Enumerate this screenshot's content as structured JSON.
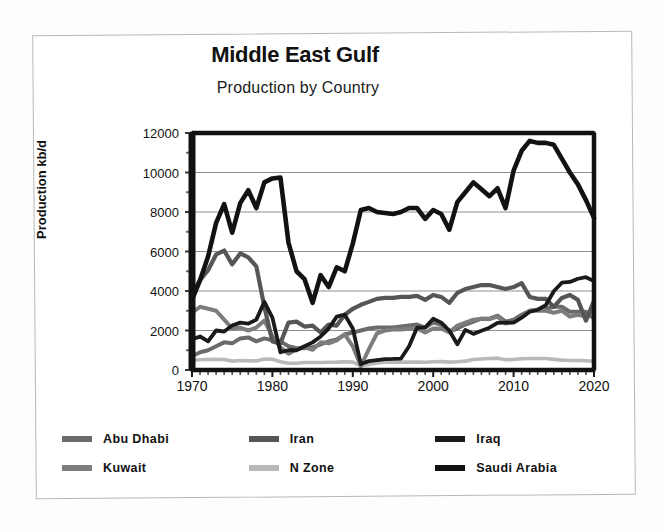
{
  "chart_data": {
    "type": "line",
    "title": "Middle East Gulf",
    "subtitle": "Production by Country",
    "xlabel": "",
    "ylabel": "Production kb/d",
    "xlim": [
      1970,
      2020
    ],
    "ylim": [
      0,
      12000
    ],
    "ytick_step": 2000,
    "yticks": [
      "0",
      "2000",
      "4000",
      "6000",
      "8000",
      "10000",
      "12000"
    ],
    "xticks": [
      "1970",
      "1980",
      "1990",
      "2000",
      "2010",
      "2020"
    ],
    "xtick_minor_step": 1,
    "grid": "horizontal",
    "legend_position": "below",
    "x": [
      1970,
      1971,
      1972,
      1973,
      1974,
      1975,
      1976,
      1977,
      1978,
      1979,
      1980,
      1981,
      1982,
      1983,
      1984,
      1985,
      1986,
      1987,
      1988,
      1989,
      1990,
      1991,
      1992,
      1993,
      1994,
      1995,
      1996,
      1997,
      1998,
      1999,
      2000,
      2001,
      2002,
      2003,
      2004,
      2005,
      2006,
      2007,
      2008,
      2009,
      2010,
      2011,
      2012,
      2013,
      2014,
      2015,
      2016,
      2017,
      2018,
      2019,
      2020
    ],
    "series": [
      {
        "name": "Saudi Arabia",
        "color": "#121212",
        "width": 4.6,
        "values": [
          3550,
          4550,
          5750,
          7450,
          8400,
          6950,
          8450,
          9100,
          8200,
          9500,
          9700,
          9750,
          6450,
          5000,
          4600,
          3400,
          4800,
          4200,
          5200,
          5000,
          6400,
          8100,
          8200,
          8000,
          7950,
          7900,
          8000,
          8200,
          8200,
          7650,
          8100,
          7900,
          7100,
          8500,
          9000,
          9500,
          9150,
          8800,
          9200,
          8200,
          10100,
          11100,
          11600,
          11500,
          11500,
          11400,
          10700,
          10000,
          9400,
          8600,
          7700
        ]
      },
      {
        "name": "Iran",
        "color": "#565656",
        "width": 4.2,
        "values": [
          3850,
          4550,
          5050,
          5850,
          6050,
          5350,
          5900,
          5700,
          5250,
          3200,
          1450,
          1350,
          2400,
          2450,
          2200,
          2250,
          1900,
          2300,
          2250,
          2800,
          3100,
          3300,
          3450,
          3600,
          3650,
          3650,
          3700,
          3700,
          3750,
          3550,
          3800,
          3700,
          3400,
          3900,
          4100,
          4200,
          4300,
          4300,
          4200,
          4100,
          4200,
          4400,
          3700,
          3600,
          3600,
          3200,
          3650,
          3800,
          3550,
          2500,
          3500
        ]
      },
      {
        "name": "Iraq",
        "color": "#1a1a1a",
        "width": 3.8,
        "values": [
          1550,
          1700,
          1450,
          2000,
          1950,
          2250,
          2400,
          2350,
          2550,
          3450,
          2650,
          900,
          1000,
          1000,
          1200,
          1400,
          1700,
          2100,
          2700,
          2800,
          2100,
          300,
          450,
          500,
          550,
          560,
          580,
          1200,
          2150,
          2150,
          2600,
          2400,
          2000,
          1300,
          2030,
          1830,
          1990,
          2140,
          2390,
          2400,
          2400,
          2650,
          2950,
          3050,
          3280,
          3990,
          4420,
          4460,
          4620,
          4700,
          4500
        ]
      },
      {
        "name": "Kuwait",
        "color": "#7d7d7d",
        "width": 4.0,
        "values": [
          2900,
          3200,
          3100,
          3000,
          2550,
          2100,
          2150,
          2000,
          2150,
          2500,
          1700,
          1150,
          820,
          1050,
          1150,
          1020,
          1400,
          1350,
          1500,
          1800,
          1200,
          190,
          1060,
          1850,
          2000,
          2050,
          2050,
          2100,
          2100,
          1900,
          2100,
          2100,
          1900,
          2250,
          2400,
          2550,
          2600,
          2580,
          2700,
          2350,
          2450,
          2700,
          3000,
          3000,
          3000,
          2900,
          3000,
          2700,
          2800,
          2700,
          2900
        ]
      },
      {
        "name": "Abu Dhabi",
        "color": "#6b6b6b",
        "width": 4.0,
        "values": [
          700,
          900,
          1000,
          1200,
          1400,
          1350,
          1600,
          1650,
          1450,
          1600,
          1500,
          1450,
          1200,
          1100,
          1100,
          1150,
          1300,
          1450,
          1550,
          1800,
          1900,
          2000,
          2100,
          2150,
          2150,
          2150,
          2200,
          2250,
          2300,
          2150,
          2400,
          2300,
          1950,
          2100,
          2300,
          2450,
          2600,
          2600,
          2750,
          2450,
          2550,
          2800,
          3000,
          3050,
          3100,
          3200,
          3200,
          2950,
          2950,
          2950,
          2600
        ]
      },
      {
        "name": "N Zone",
        "color": "#b9b9b9",
        "width": 3.6,
        "values": [
          500,
          520,
          530,
          540,
          530,
          450,
          480,
          470,
          460,
          560,
          540,
          420,
          340,
          340,
          380,
          380,
          380,
          390,
          400,
          420,
          400,
          210,
          280,
          360,
          400,
          400,
          400,
          400,
          400,
          390,
          420,
          430,
          400,
          420,
          450,
          530,
          560,
          580,
          600,
          520,
          530,
          570,
          580,
          580,
          580,
          540,
          500,
          480,
          480,
          470,
          440
        ]
      }
    ]
  },
  "legend": {
    "items": [
      {
        "label": "Abu Dhabi",
        "color": "#6b6b6b"
      },
      {
        "label": "Iran",
        "color": "#565656"
      },
      {
        "label": "Iraq",
        "color": "#1a1a1a"
      },
      {
        "label": "Kuwait",
        "color": "#7d7d7d"
      },
      {
        "label": "N Zone",
        "color": "#b9b9b9"
      },
      {
        "label": "Saudi Arabia",
        "color": "#121212"
      }
    ]
  }
}
